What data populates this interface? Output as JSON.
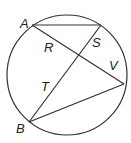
{
  "diagram": {
    "type": "circle-with-chords",
    "stroke_color": "#333333",
    "circle": {
      "cx": 67,
      "cy": 75,
      "r": 60
    },
    "points": {
      "A": {
        "x": 32,
        "y": 25
      },
      "C": {
        "x": 101,
        "y": 25
      },
      "V": {
        "x": 124,
        "y": 84
      },
      "B": {
        "x": 29,
        "y": 122
      },
      "X": {
        "x": 78,
        "y": 55
      }
    },
    "segments": [
      {
        "name": "chord-a-top",
        "from": "A",
        "to": "C"
      },
      {
        "name": "chord-a-v",
        "from": "A",
        "to": "V"
      },
      {
        "name": "chord-top-b",
        "from": "C",
        "to": "B"
      },
      {
        "name": "chord-b-v",
        "from": "B",
        "to": "V"
      }
    ],
    "labels": [
      {
        "id": "A",
        "text": "A",
        "x": 20,
        "y": 28
      },
      {
        "id": "R",
        "text": "R",
        "x": 44,
        "y": 52
      },
      {
        "id": "S",
        "text": "S",
        "x": 92,
        "y": 47
      },
      {
        "id": "V",
        "text": "V",
        "x": 109,
        "y": 70
      },
      {
        "id": "T",
        "text": "T",
        "x": 41,
        "y": 91
      },
      {
        "id": "B",
        "text": "B",
        "x": 16,
        "y": 133
      }
    ]
  }
}
